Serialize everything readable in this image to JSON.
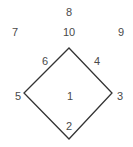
{
  "diagram": {
    "shape": "diamond",
    "line_color": "#333333",
    "label_color": "#4a4a4a",
    "vertices": {
      "top": [
        69,
        48
      ],
      "right": [
        112,
        93
      ],
      "bottom": [
        69,
        139
      ],
      "left": [
        24,
        93
      ]
    },
    "labels": [
      {
        "id": "1",
        "text": "1",
        "x": 70,
        "y": 96,
        "position": "center"
      },
      {
        "id": "2",
        "text": "2",
        "x": 69,
        "y": 126,
        "position": "above-bottom-vertex"
      },
      {
        "id": "3",
        "text": "3",
        "x": 120,
        "y": 96,
        "position": "right-of-right-vertex"
      },
      {
        "id": "4",
        "text": "4",
        "x": 97,
        "y": 61,
        "position": "upper-right-edge"
      },
      {
        "id": "5",
        "text": "5",
        "x": 18,
        "y": 96,
        "position": "left-of-left-vertex"
      },
      {
        "id": "6",
        "text": "6",
        "x": 45,
        "y": 61,
        "position": "upper-left-edge"
      },
      {
        "id": "7",
        "text": "7",
        "x": 15,
        "y": 32,
        "position": "outside-upper-left"
      },
      {
        "id": "8",
        "text": "8",
        "x": 69,
        "y": 12,
        "position": "outside-top"
      },
      {
        "id": "9",
        "text": "9",
        "x": 121,
        "y": 32,
        "position": "outside-upper-right"
      },
      {
        "id": "10",
        "text": "10",
        "x": 69,
        "y": 32,
        "position": "above-top-vertex"
      }
    ]
  }
}
